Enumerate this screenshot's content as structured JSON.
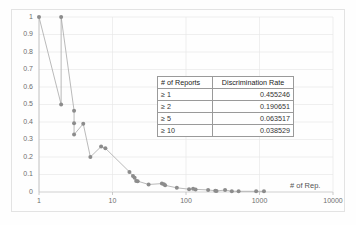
{
  "chart_data": {
    "type": "scatter",
    "title": "",
    "xlabel": "# of Rep.",
    "ylabel": "",
    "xscale": "log",
    "xlim": [
      1,
      10000
    ],
    "ylim": [
      0,
      1
    ],
    "grid": true,
    "legend": "none",
    "xticks": [
      "1",
      "10",
      "100",
      "1000",
      "10000"
    ],
    "xtick_values": [
      1,
      10,
      100,
      1000,
      10000
    ],
    "yticks": [
      "0",
      "0.1",
      "0.2",
      "0.3",
      "0.4",
      "0.5",
      "0.6",
      "0.7",
      "0.8",
      "0.9",
      "1"
    ],
    "ytick_values": [
      0,
      0.1,
      0.2,
      0.3,
      0.4,
      0.5,
      0.6,
      0.7,
      0.8,
      0.9,
      1
    ],
    "series": [
      {
        "name": "Discrimination Rate by # of Reports",
        "marker": "circle",
        "color": "#8c8c8c",
        "line_color": "#a8a8a8",
        "points": [
          [
            1,
            1.0
          ],
          [
            2,
            0.5
          ],
          [
            2,
            1.0
          ],
          [
            3,
            0.465
          ],
          [
            3,
            0.393
          ],
          [
            3,
            0.328
          ],
          [
            4,
            0.39
          ],
          [
            5,
            0.2
          ],
          [
            7,
            0.26
          ],
          [
            8,
            0.25
          ],
          [
            17,
            0.115
          ],
          [
            19,
            0.092
          ],
          [
            20,
            0.082
          ],
          [
            21,
            0.063
          ],
          [
            22,
            0.062
          ],
          [
            31,
            0.043
          ],
          [
            47,
            0.048
          ],
          [
            50,
            0.044
          ],
          [
            52,
            0.038
          ],
          [
            75,
            0.024
          ],
          [
            110,
            0.016
          ],
          [
            125,
            0.018
          ],
          [
            135,
            0.015
          ],
          [
            200,
            0.012
          ],
          [
            250,
            0.007
          ],
          [
            260,
            0.006
          ],
          [
            340,
            0.011
          ],
          [
            420,
            0.005
          ],
          [
            520,
            0.004
          ],
          [
            900,
            0.004
          ],
          [
            1150,
            0.004
          ]
        ]
      }
    ]
  },
  "inset_table": {
    "name": "discrimination-rate-table",
    "headers": [
      "# of Reports",
      "Discrimination Rate"
    ],
    "rows": [
      [
        "≥ 1",
        "0.455246"
      ],
      [
        "≥ 2",
        "0.190651"
      ],
      [
        "≥ 5",
        "0.063517"
      ],
      [
        "≥ 10",
        "0.038529"
      ]
    ]
  },
  "colors": {
    "marker": "#8c8c8c",
    "line": "#a8a8a8",
    "grid": "#e8e8e8",
    "axis": "#bdbdbd",
    "border": "#e3e3e3",
    "text": "#6e6e6e"
  }
}
